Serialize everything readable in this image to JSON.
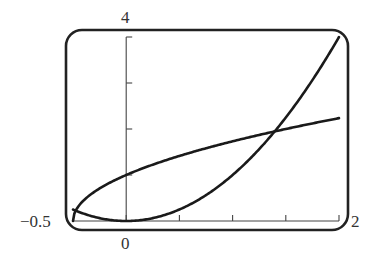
{
  "chart_data": {
    "type": "line",
    "title": "",
    "xlabel": "",
    "ylabel": "",
    "xlim": [
      -0.5,
      2
    ],
    "ylim": [
      0,
      4
    ],
    "grid": false,
    "legend": null,
    "x_ticks": [
      0,
      0.5,
      1,
      1.5,
      2
    ],
    "y_ticks": [
      1,
      2,
      3,
      4
    ],
    "tick_labels": {
      "x_min": "−0.5",
      "x_origin": "0",
      "x_max": "2",
      "y_max": "4"
    },
    "series": [
      {
        "name": "parabola y = x^2",
        "x": [
          -0.5,
          -0.25,
          0,
          0.25,
          0.5,
          0.75,
          1,
          1.25,
          1.5,
          1.75,
          2
        ],
        "y": [
          0.25,
          0.0625,
          0,
          0.0625,
          0.25,
          0.5625,
          1,
          1.5625,
          2.25,
          3.0625,
          4
        ]
      },
      {
        "name": "root curve y = sqrt(2x+1)",
        "x": [
          -0.5,
          -0.45,
          -0.4,
          -0.3,
          -0.2,
          0,
          0.25,
          0.5,
          0.75,
          1,
          1.25,
          1.5,
          1.75,
          2
        ],
        "y": [
          0,
          0.316,
          0.447,
          0.632,
          0.775,
          1,
          1.225,
          1.414,
          1.581,
          1.732,
          1.871,
          2,
          2.121,
          2.236
        ]
      }
    ],
    "annotations": [
      {
        "text": "intersection",
        "x": 1.395,
        "y": 1.946
      }
    ]
  },
  "labels": {
    "y_max": "4",
    "x_min": "−0.5",
    "x_origin": "0",
    "x_max": "2"
  }
}
